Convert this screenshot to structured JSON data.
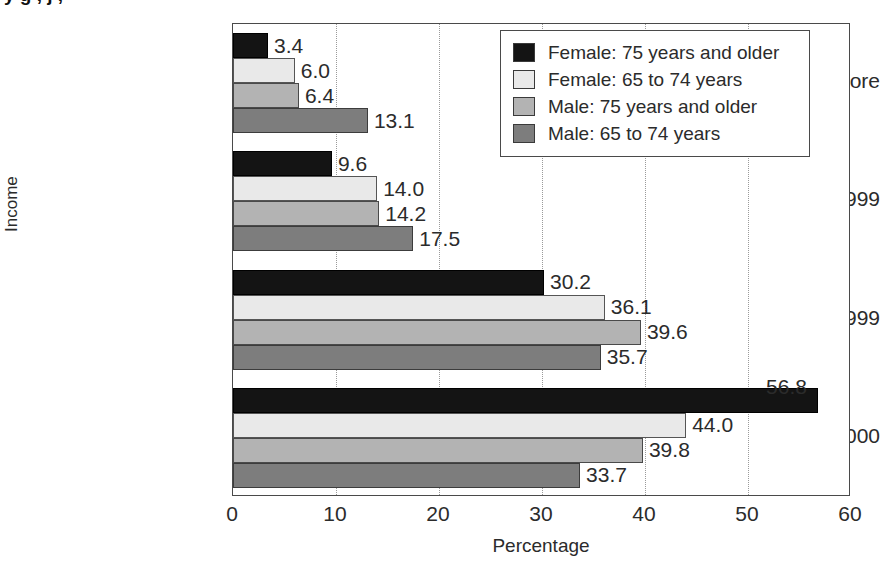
{
  "title_fragment": "y  g                  , j            ,",
  "chart_data": {
    "type": "bar",
    "orientation": "horizontal",
    "title": "",
    "xlabel": "Percentage",
    "ylabel": "Income",
    "xlim": [
      0,
      60
    ],
    "xticks": [
      0,
      10,
      20,
      30,
      40,
      50,
      60
    ],
    "grid": "vertical-dotted",
    "legend_position": "top-right-inside",
    "categories": [
      "$35,000 or more",
      "$20,000 to $34,999",
      "$10,000 to 19,999",
      "Less than $10,000"
    ],
    "series": [
      {
        "name": "Female: 75 years and older",
        "color": "#141414",
        "values": [
          3.4,
          9.6,
          30.2,
          56.8
        ]
      },
      {
        "name": "Female: 65 to 74 years",
        "color": "#e9e9e9",
        "values": [
          6.0,
          14.0,
          36.1,
          44.0
        ]
      },
      {
        "name": "Male: 75 years and older",
        "color": "#b3b3b3",
        "values": [
          6.4,
          14.2,
          39.6,
          39.8
        ]
      },
      {
        "name": "Male: 65 to 74 years",
        "color": "#7d7d7d",
        "values": [
          13.1,
          17.5,
          35.7,
          33.7
        ]
      }
    ],
    "data_labels": [
      [
        "3.4",
        "6.0",
        "6.4",
        "13.1"
      ],
      [
        "9.6",
        "14.0",
        "14.2",
        "17.5"
      ],
      [
        "30.2",
        "36.1",
        "39.6",
        "35.7"
      ],
      [
        "56.8",
        "44.0",
        "39.8",
        "33.7"
      ]
    ]
  }
}
